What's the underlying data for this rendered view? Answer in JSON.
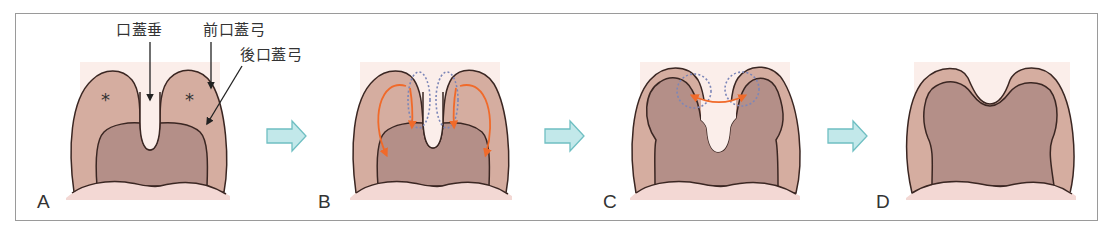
{
  "figure": {
    "panels": [
      {
        "id": "A",
        "label": "A"
      },
      {
        "id": "B",
        "label": "B"
      },
      {
        "id": "C",
        "label": "C"
      },
      {
        "id": "D",
        "label": "D"
      }
    ],
    "annotations": {
      "uvula": "口蓋垂",
      "anterior_pillar": "前口蓋弓",
      "posterior_pillar": "後口蓋弓",
      "asterisk": "*"
    },
    "colors": {
      "background_tint": "#fbeeea",
      "outer_pillar": "#d5ada0",
      "inner_pharynx": "#b48f88",
      "tongue": "#f3d8d4",
      "outline": "#3a2622",
      "orange_arrow": "#f06a2a",
      "dotted_circle": "#7c86b8",
      "step_arrow_fill": "#c2e8ea",
      "step_arrow_stroke": "#6fbfc2",
      "frame_border": "#9a9a9a"
    }
  }
}
